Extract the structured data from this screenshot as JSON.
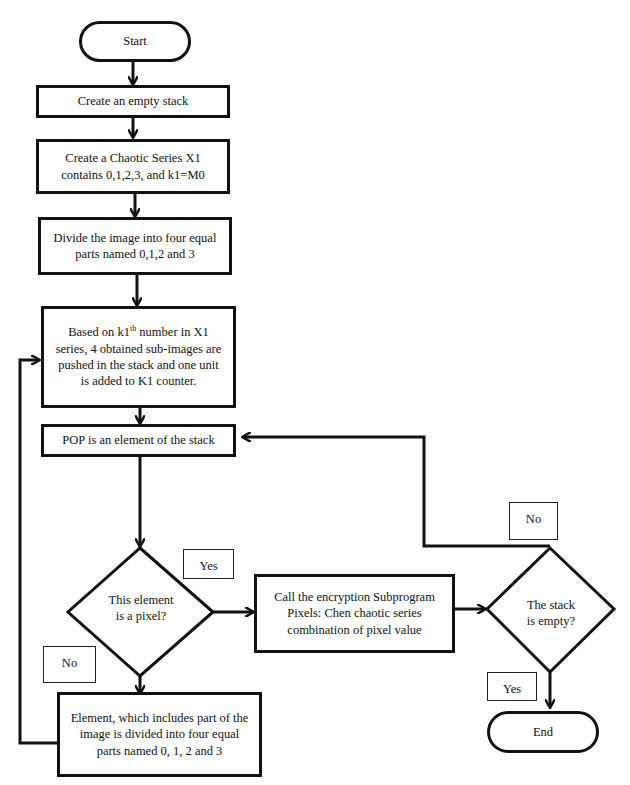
{
  "flowchart": {
    "start": "Start",
    "create_stack": "Create an empty stack",
    "create_series": "Create a Chaotic Series X1 contains 0,1,2,3, and k1=M0",
    "divide_image": "Divide the image into four equal parts named 0,1,2 and 3",
    "push_sub_images_pre": "Based on k1",
    "push_sub_images_sup": "th",
    "push_sub_images_post": " number in X1 series, 4 obtained sub-images are pushed in the stack and one unit is added to K1 counter.",
    "pop": "POP is an element of the stack",
    "decision_pixel": "This element is a pixel?",
    "encrypt": "Call the encryption Subprogram Pixels: Chen chaotic series combination of pixel value",
    "decision_empty": "The stack is empty?",
    "subdivide": "Element, which includes part of the image is divided into four equal parts named 0, 1, 2 and 3",
    "end": "End",
    "labels": {
      "pixel_yes": "Yes",
      "pixel_no": "No",
      "empty_no": "No",
      "empty_yes": "Yes"
    }
  }
}
